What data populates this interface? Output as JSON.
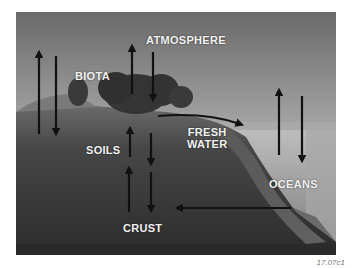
{
  "figure": {
    "labels": {
      "atmosphere": "ATMOSPHERE",
      "biota": "BIOTA",
      "soils": "SOILS",
      "fresh_water_line1": "FRESH",
      "fresh_water_line2": "WATER",
      "oceans": "OCEANS",
      "crust": "CRUST"
    },
    "caption": "17.07c1",
    "arrows": [
      {
        "name": "atmosphere-land-up",
        "direction": "up"
      },
      {
        "name": "atmosphere-land-down",
        "direction": "down"
      },
      {
        "name": "biota-atmosphere-up",
        "direction": "up"
      },
      {
        "name": "atmosphere-biota-down",
        "direction": "down"
      },
      {
        "name": "biota-fresh-water-curve",
        "direction": "right"
      },
      {
        "name": "soils-biota-up",
        "direction": "up"
      },
      {
        "name": "biota-soils-down",
        "direction": "down"
      },
      {
        "name": "crust-soils-up",
        "direction": "up"
      },
      {
        "name": "soils-crust-down",
        "direction": "down"
      },
      {
        "name": "oceans-atmosphere-up",
        "direction": "up"
      },
      {
        "name": "atmosphere-oceans-down",
        "direction": "down"
      },
      {
        "name": "oceans-crust-left",
        "direction": "left"
      }
    ],
    "colors": {
      "sky_top": "#6e6e6e",
      "sky_bottom": "#d4d4d4",
      "land": "#3e3e3e",
      "ocean": "#9a9a9a",
      "arrow": "#111111",
      "label": "#f2f2f2"
    }
  }
}
